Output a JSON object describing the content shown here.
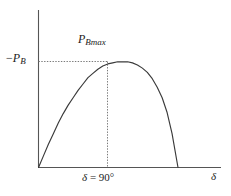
{
  "figure": {
    "title": "",
    "background_color": "#ffffff",
    "line_color": "#3a3a3a",
    "axis_color": "#555555",
    "guide_color": "#7a7a7a"
  },
  "labels": {
    "y_value_prefix": "−",
    "y_value_base": "P",
    "y_value_sub": "B",
    "peak_base": "P",
    "peak_sub": "Bmax",
    "x_tick_symbol": "δ",
    "x_tick_rest": " = 90°",
    "x_axis_symbol": "δ"
  },
  "chart_data": {
    "type": "line",
    "title": "",
    "xlabel": "δ",
    "ylabel": "−P_B",
    "annotations": [
      {
        "name": "peak-label",
        "text": "P_Bmax",
        "x": 90,
        "y": 1.0
      },
      {
        "name": "y-level-label",
        "text": "−P_B",
        "x": 0,
        "y": 1.0
      },
      {
        "name": "x-tick-label",
        "text": "δ = 90°",
        "x": 90,
        "y": 0
      }
    ],
    "grid": false,
    "legend": false,
    "xlim": [
      0,
      141
    ],
    "ylim": [
      0,
      1.12
    ],
    "x_tick_values": [
      90
    ],
    "x_tick_labels": [
      "δ = 90°"
    ],
    "y_tick_values": [
      1.0
    ],
    "y_tick_labels": [
      "−P_B"
    ],
    "guide_lines": [
      {
        "name": "horizontal-peak-guide",
        "orientation": "horizontal",
        "y": 1.0,
        "x_from": 0,
        "x_to": 90,
        "style": "dotted"
      },
      {
        "name": "vertical-peak-guide",
        "orientation": "vertical",
        "x": 90,
        "y_from": 0,
        "y_to": 1.0,
        "style": "dotted"
      }
    ],
    "series": [
      {
        "name": "brake-power-curve",
        "description": "power vs load angle, rises from origin to maximum at delta = 90 deg then falls to zero",
        "x": [
          0,
          5,
          10,
          15,
          20,
          25,
          30,
          35,
          40,
          45,
          50,
          55,
          60,
          65,
          70,
          75,
          80,
          85,
          90,
          95,
          100,
          105,
          110,
          115,
          120,
          125,
          130,
          135,
          141
        ],
        "y": [
          0.0,
          0.11,
          0.22,
          0.32,
          0.42,
          0.51,
          0.59,
          0.66,
          0.73,
          0.79,
          0.85,
          0.89,
          0.93,
          0.96,
          0.98,
          0.99,
          1.0,
          1.0,
          1.0,
          0.99,
          0.97,
          0.94,
          0.9,
          0.84,
          0.76,
          0.66,
          0.52,
          0.32,
          0.0
        ]
      }
    ]
  }
}
